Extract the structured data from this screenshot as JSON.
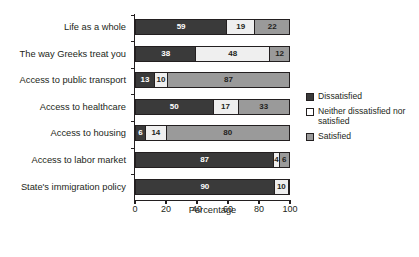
{
  "chart_data": {
    "type": "bar",
    "orientation": "horizontal",
    "stacked": true,
    "title": "",
    "xlabel": "Percentage",
    "ylabel": "",
    "xlim": [
      0,
      100
    ],
    "xticks": [
      0,
      20,
      40,
      60,
      80,
      100
    ],
    "grid": false,
    "legend_position": "right",
    "categories": [
      "Life as a whole",
      "The way Greeks treat you",
      "Access to public transport",
      "Access to healthcare",
      "Access to housing",
      "Access to labor market",
      "State's immigration policy"
    ],
    "series": [
      {
        "name": "Dissatisfied",
        "color": "#3a3a3a",
        "values": [
          59,
          38,
          13,
          50,
          6,
          87,
          90
        ]
      },
      {
        "name": "Neither dissatisfied nor satisfied",
        "color": "#efefef",
        "values": [
          19,
          48,
          10,
          17,
          14,
          4,
          10
        ]
      },
      {
        "name": "Satisfied",
        "color": "#9a9a9a",
        "values": [
          22,
          12,
          87,
          33,
          80,
          6,
          0
        ]
      }
    ]
  },
  "legend": {
    "items": [
      {
        "label": "Dissatisfied",
        "swatch": "dis"
      },
      {
        "label": "Neither dissatisfied nor satisfied",
        "swatch": "neu"
      },
      {
        "label": "Satisfied",
        "swatch": "sat"
      }
    ]
  },
  "axis": {
    "x_title": "Percentage",
    "x_tick_labels": [
      "0",
      "20",
      "40",
      "60",
      "80",
      "100"
    ]
  }
}
